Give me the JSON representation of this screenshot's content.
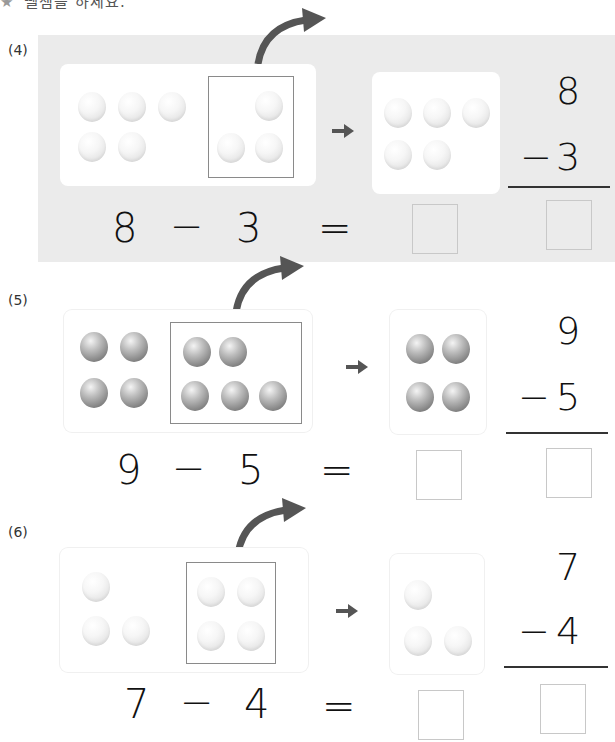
{
  "instruction": {
    "icon": "star-icon",
    "text": "뺄셈을 하세요."
  },
  "problems": [
    {
      "label": "(4)",
      "minuend": "8",
      "subtrahend": "3",
      "minus": "−",
      "equals": "=",
      "ball_color": "white",
      "left_balls": 5,
      "boxed_balls": 3,
      "result_balls": 5,
      "vertical": {
        "top": "8",
        "bottom": "3",
        "op": "−"
      },
      "highlighted": true
    },
    {
      "label": "(5)",
      "minuend": "9",
      "subtrahend": "5",
      "minus": "−",
      "equals": "=",
      "ball_color": "gray",
      "left_balls": 4,
      "boxed_balls": 5,
      "result_balls": 4,
      "vertical": {
        "top": "9",
        "bottom": "5",
        "op": "−"
      },
      "highlighted": false
    },
    {
      "label": "(6)",
      "minuend": "7",
      "subtrahend": "4",
      "minus": "−",
      "equals": "=",
      "ball_color": "white",
      "left_balls": 3,
      "boxed_balls": 4,
      "result_balls": 3,
      "vertical": {
        "top": "7",
        "bottom": "4",
        "op": "−"
      },
      "highlighted": false
    }
  ],
  "colors": {
    "highlight_bg": "#ebebeb",
    "arrow": "#555555",
    "box_border": "#8a8a8a",
    "answer_border": "#c8c8c8"
  }
}
